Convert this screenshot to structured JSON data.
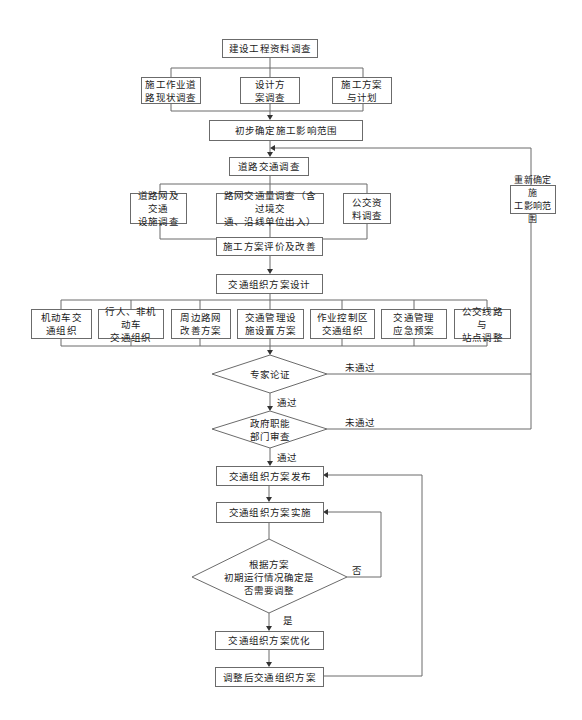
{
  "diagram": {
    "type": "flowchart",
    "colors": {
      "line": "#6b6b6b",
      "text": "#1a1a1a",
      "background": "#ffffff"
    },
    "nodes": {
      "n_project_info": {
        "label": "建设工程资料调查"
      },
      "n_road_status": {
        "label": "施工作业道\n路现状调查"
      },
      "n_design_plan": {
        "label": "设计方\n案调查"
      },
      "n_construction_plan": {
        "label": "施工方案\n与计划"
      },
      "n_initial_scope": {
        "label": "初步确定施工影响范围"
      },
      "n_traffic_survey": {
        "label": "道路交通调查"
      },
      "n_road_network": {
        "label": "道路网及交通\n设施调查"
      },
      "n_volume_survey": {
        "label": "路网交通量调查（含过境交\n通、沿线单位出入）"
      },
      "n_transit_data": {
        "label": "公交资\n料调查"
      },
      "n_redefine_scope": {
        "label": "重新确定施\n工影响范围"
      },
      "n_plan_eval": {
        "label": "施工方案评价及改善"
      },
      "n_org_design": {
        "label": "交通组织方案设计"
      },
      "n_motor": {
        "label": "机动车交\n通组织"
      },
      "n_ped_nonmotor": {
        "label": "行人、非机动车\n交通组织"
      },
      "n_nearby_network": {
        "label": "周边路网\n改善方案"
      },
      "n_facilities": {
        "label": "交通管理设\n施设置方案"
      },
      "n_work_zone": {
        "label": "作业控制区\n交通组织"
      },
      "n_emergency": {
        "label": "交通管理\n应急预案"
      },
      "n_bus_route": {
        "label": "公交线路与\n站点调整"
      },
      "d_expert": {
        "label": "专家论证"
      },
      "d_gov": {
        "label": "政府职能\n部门审查"
      },
      "n_publish": {
        "label": "交通组织方案发布"
      },
      "n_implement": {
        "label": "交通组织方案实施"
      },
      "d_adjust": {
        "label": "根据方案\n初期运行情况确定是\n否需要调整"
      },
      "n_optimize": {
        "label": "交通组织方案优化"
      },
      "n_adjusted": {
        "label": "调整后交通组织方案"
      }
    },
    "edge_labels": {
      "expert_fail": "未通过",
      "expert_pass": "通过",
      "gov_fail": "未通过",
      "gov_pass": "通过",
      "adjust_no": "否",
      "adjust_yes": "是"
    }
  }
}
